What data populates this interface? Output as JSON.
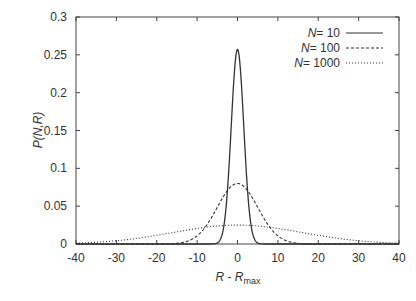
{
  "chart_data": {
    "type": "line",
    "title": "",
    "xlabel": "R - R_max",
    "xlabel_main": "R - R",
    "xlabel_sub": "max",
    "ylabel": "P(N,R)",
    "xlim": [
      -40,
      40
    ],
    "ylim": [
      0,
      0.3
    ],
    "x_ticks": [
      -40,
      -30,
      -20,
      -10,
      0,
      10,
      20,
      30,
      40
    ],
    "x_tick_labels": [
      "-40",
      "-30",
      "-20",
      "-10",
      "0",
      "10",
      "20",
      "30",
      "40"
    ],
    "y_ticks": [
      0,
      0.05,
      0.1,
      0.15,
      0.2,
      0.25,
      0.3
    ],
    "y_tick_labels": [
      "0",
      "0.05",
      "0.1",
      "0.15",
      "0.2",
      "0.25",
      "0.3"
    ],
    "grid": false,
    "legend_position": "upper right",
    "series": [
      {
        "name": "N = 10",
        "label_var": "N",
        "label_val": "= 10",
        "style": "solid",
        "peak": 0.257,
        "sigma": 1.55
      },
      {
        "name": "N = 100",
        "label_var": "N",
        "label_val": "= 100",
        "style": "dashed",
        "peak": 0.08,
        "sigma": 5.0
      },
      {
        "name": "N = 1000",
        "label_var": "N",
        "label_val": "= 1000",
        "style": "dotted",
        "peak": 0.025,
        "sigma": 16.0
      }
    ]
  }
}
